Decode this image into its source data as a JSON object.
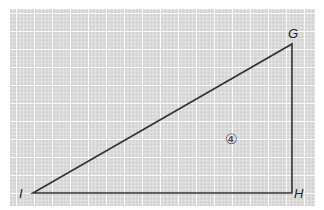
{
  "diagram": {
    "type": "right-triangle-on-grid",
    "background": {
      "grid_color": "#d3d3d3",
      "line_color": "#ffffff"
    },
    "stroke_color": "#333333",
    "vertices": [
      {
        "label": "G",
        "x": 292,
        "y": 44
      },
      {
        "label": "H",
        "x": 292,
        "y": 193
      },
      {
        "label": "I",
        "x": 33,
        "y": 193
      }
    ],
    "region_marker": "④"
  }
}
